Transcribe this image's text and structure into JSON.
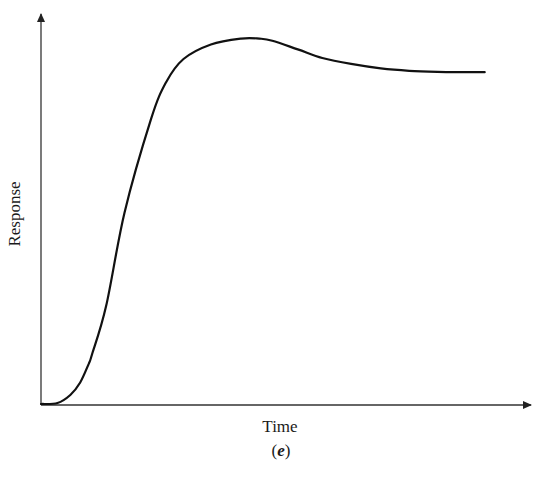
{
  "chart_data": {
    "type": "line",
    "title": "",
    "xlabel": "Time",
    "ylabel": "Response",
    "caption": "(e)",
    "caption_letter": "e",
    "grid": false,
    "legend": null,
    "xticks": [],
    "yticks": [],
    "xlim": [
      0,
      1
    ],
    "ylim": [
      0,
      1.05
    ],
    "series": [
      {
        "name": "response",
        "color": "#111111",
        "x": [
          0.0,
          0.035,
          0.062,
          0.083,
          0.101,
          0.108,
          0.138,
          0.177,
          0.233,
          0.265,
          0.302,
          0.36,
          0.424,
          0.463,
          0.49,
          0.544,
          0.596,
          0.657,
          0.72,
          0.78,
          0.84,
          0.9,
          0.94
        ],
        "y": [
          0.0,
          0.003,
          0.026,
          0.062,
          0.116,
          0.143,
          0.283,
          0.553,
          0.823,
          0.93,
          0.997,
          1.039,
          1.056,
          1.056,
          1.05,
          1.025,
          1.0,
          0.983,
          0.97,
          0.963,
          0.96,
          0.959,
          0.959
        ]
      }
    ],
    "annotations": [
      {
        "text": "peak overshoot",
        "x": 0.463,
        "y": 1.056
      },
      {
        "text": "steady state",
        "x": 0.94,
        "y": 0.959
      }
    ]
  },
  "axes": {
    "y_label": "Response",
    "x_label": "Time"
  },
  "figure": {
    "caption_open": "(",
    "caption_letter": "e",
    "caption_close": ")"
  },
  "colors": {
    "axis": "#333333",
    "curve": "#111111",
    "background": "#ffffff"
  }
}
